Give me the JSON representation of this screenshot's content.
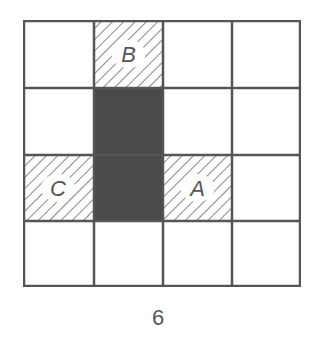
{
  "figure": {
    "rows": 4,
    "cols": 4,
    "caption": "6",
    "colors": {
      "line": "#555555",
      "filled": "#4a4a4a",
      "hatch": "#6a6a6a",
      "background": "#ffffff"
    },
    "filled_cells": [
      {
        "row": 1,
        "col": 1
      },
      {
        "row": 2,
        "col": 1
      }
    ],
    "hatched_cells": [
      {
        "row": 0,
        "col": 1,
        "label": "B"
      },
      {
        "row": 2,
        "col": 0,
        "label": "C"
      },
      {
        "row": 2,
        "col": 2,
        "label": "A"
      }
    ]
  }
}
